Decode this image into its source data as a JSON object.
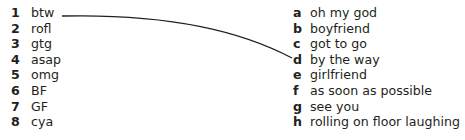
{
  "exercise": {
    "left_column": [
      {
        "number": "1",
        "term": "btw"
      },
      {
        "number": "2",
        "term": "rofl"
      },
      {
        "number": "3",
        "term": "gtg"
      },
      {
        "number": "4",
        "term": "asap"
      },
      {
        "number": "5",
        "term": "omg"
      },
      {
        "number": "6",
        "term": "BF"
      },
      {
        "number": "7",
        "term": "GF"
      },
      {
        "number": "8",
        "term": "cya"
      }
    ],
    "right_column": [
      {
        "letter": "a",
        "meaning": "oh my god"
      },
      {
        "letter": "b",
        "meaning": "boyfriend"
      },
      {
        "letter": "c",
        "meaning": "got to go"
      },
      {
        "letter": "d",
        "meaning": "by the way"
      },
      {
        "letter": "e",
        "meaning": "girlfriend"
      },
      {
        "letter": "f",
        "meaning": "as soon as possible"
      },
      {
        "letter": "g",
        "meaning": "see you"
      },
      {
        "letter": "h",
        "meaning": "rolling on floor laughing"
      }
    ],
    "example_match": {
      "from": "1",
      "to": "d"
    },
    "line_color": "#231f20"
  }
}
